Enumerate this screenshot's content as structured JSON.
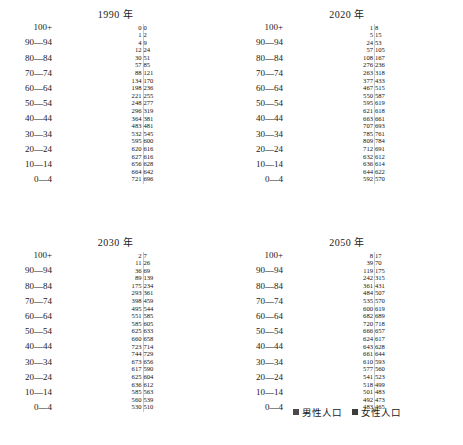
{
  "legend": {
    "male_label": "男性人口",
    "female_label": "女性人口",
    "male_color": "#8f8f8f",
    "female_color": "#4a4a4a"
  },
  "age_groups": [
    "100+",
    "95—99",
    "90—94",
    "85—89",
    "80—84",
    "75—79",
    "70—74",
    "65—69",
    "60—64",
    "55—59",
    "50—54",
    "45—49",
    "40—44",
    "35—39",
    "30—34",
    "25—29",
    "20—24",
    "15—19",
    "10—14",
    "5—9",
    "0—4"
  ],
  "visible_age_labels": [
    "100+",
    "",
    "90—94",
    "",
    "80—84",
    "",
    "70—74",
    "",
    "60—64",
    "",
    "50—54",
    "",
    "40—44",
    "",
    "30—34",
    "",
    "20—24",
    "",
    "10—14",
    "",
    "0—4"
  ],
  "chart_data": [
    {
      "type": "bar",
      "title": "1990 年",
      "xlabel": "",
      "ylabel": "",
      "categories": [
        "100+",
        "95—99",
        "90—94",
        "85—89",
        "80—84",
        "75—79",
        "70—74",
        "65—69",
        "60—64",
        "55—59",
        "50—54",
        "45—49",
        "40—44",
        "35—39",
        "30—34",
        "25—29",
        "20—24",
        "15—19",
        "10—14",
        "5—9",
        "0—4"
      ],
      "series": [
        {
          "name": "男性人口",
          "values": [
            0,
            1,
            4,
            12,
            30,
            57,
            88,
            134,
            198,
            221,
            248,
            296,
            364,
            483,
            532,
            595,
            620,
            627,
            656,
            664,
            721
          ]
        },
        {
          "name": "女性人口",
          "values": [
            0,
            2,
            9,
            24,
            51,
            85,
            121,
            170,
            236,
            255,
            277,
            319,
            381,
            481,
            545,
            600,
            616,
            616,
            628,
            642,
            696
          ]
        }
      ]
    },
    {
      "type": "bar",
      "title": "2020 年",
      "xlabel": "",
      "ylabel": "",
      "categories": [
        "100+",
        "95—99",
        "90—94",
        "85—89",
        "80—84",
        "75—79",
        "70—74",
        "65—69",
        "60—64",
        "55—59",
        "50—54",
        "45—49",
        "40—44",
        "35—39",
        "30—34",
        "25—29",
        "20—24",
        "15—19",
        "10—14",
        "5—9",
        "0—4"
      ],
      "series": [
        {
          "name": "男性人口",
          "values": [
            1,
            5,
            24,
            57,
            108,
            276,
            263,
            377,
            467,
            550,
            595,
            621,
            663,
            707,
            785,
            809,
            712,
            632,
            636,
            644,
            592
          ]
        },
        {
          "name": "女性人口",
          "values": [
            8,
            15,
            53,
            105,
            167,
            236,
            318,
            433,
            515,
            587,
            619,
            618,
            661,
            693,
            761,
            784,
            691,
            612,
            614,
            622,
            570
          ]
        }
      ]
    },
    {
      "type": "bar",
      "title": "2030 年",
      "xlabel": "",
      "ylabel": "",
      "categories": [
        "100+",
        "95—99",
        "90—94",
        "85—89",
        "80—84",
        "75—79",
        "70—74",
        "65—69",
        "60—64",
        "55—59",
        "50—54",
        "45—49",
        "40—44",
        "35—39",
        "30—34",
        "25—29",
        "20—24",
        "15—19",
        "10—14",
        "5—9",
        "0—4"
      ],
      "series": [
        {
          "name": "男性人口",
          "values": [
            2,
            11,
            36,
            89,
            175,
            293,
            398,
            495,
            551,
            585,
            625,
            660,
            723,
            744,
            673,
            617,
            625,
            636,
            585,
            560,
            530
          ]
        },
        {
          "name": "女性人口",
          "values": [
            7,
            26,
            69,
            139,
            234,
            361,
            459,
            544,
            585,
            605,
            633,
            658,
            714,
            729,
            656,
            590,
            604,
            612,
            563,
            539,
            510
          ]
        }
      ]
    },
    {
      "type": "bar",
      "title": "2050 年",
      "xlabel": "",
      "ylabel": "",
      "categories": [
        "100+",
        "95—99",
        "90—94",
        "85—89",
        "80—84",
        "75—79",
        "70—74",
        "65—69",
        "60—64",
        "55—59",
        "50—54",
        "45—49",
        "40—44",
        "35—39",
        "30—34",
        "25—29",
        "20—24",
        "15—19",
        "10—14",
        "5—9",
        "0—4"
      ],
      "series": [
        {
          "name": "男性人口",
          "values": [
            8,
            39,
            119,
            242,
            361,
            484,
            535,
            600,
            682,
            720,
            666,
            624,
            643,
            661,
            610,
            577,
            541,
            518,
            501,
            492,
            483
          ]
        },
        {
          "name": "女性人口",
          "values": [
            17,
            70,
            175,
            315,
            431,
            507,
            570,
            619,
            689,
            718,
            657,
            617,
            628,
            644,
            593,
            560,
            523,
            499,
            483,
            473,
            465
          ]
        }
      ]
    }
  ]
}
